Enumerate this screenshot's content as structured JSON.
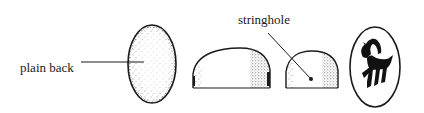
{
  "figure": {
    "views": [
      {
        "id": "back-view",
        "name": "Back view (oval)"
      },
      {
        "id": "side-view-long",
        "name": "Side profile (long axis)"
      },
      {
        "id": "side-view-short",
        "name": "Side profile (short axis) with stringhole"
      },
      {
        "id": "face-view",
        "name": "Engraved face with animal motif"
      }
    ],
    "labels": {
      "plain_back": "plain back",
      "stringhole": "stringhole"
    },
    "motif": "horned quadruped (goat/ibex)",
    "colors": {
      "ink": "#1a1a1a",
      "background": "#ffffff"
    }
  }
}
